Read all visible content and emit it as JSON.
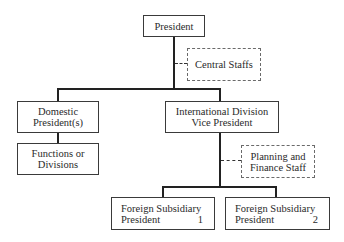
{
  "diagram": {
    "type": "organization-chart",
    "nodes": {
      "president": {
        "lines": [
          "President"
        ]
      },
      "central_staffs": {
        "lines": [
          "Central Staffs"
        ],
        "style": "dashed"
      },
      "domestic": {
        "lines": [
          "Domestic",
          "President(s)"
        ]
      },
      "functions": {
        "lines": [
          "Functions or",
          "Divisions"
        ]
      },
      "international": {
        "lines": [
          "International Division",
          "Vice President"
        ]
      },
      "planning": {
        "lines": [
          "Planning and",
          "Finance Staff"
        ],
        "style": "dashed"
      },
      "foreign1": {
        "line1": "Foreign Subsidiary",
        "line2_label": "President",
        "line2_num": "1"
      },
      "foreign2": {
        "line1": "Foreign Subsidiary",
        "line2_label": "President",
        "line2_num": "2"
      }
    },
    "edges": [
      {
        "from": "president",
        "to": "central_staffs",
        "style": "dotted"
      },
      {
        "from": "president",
        "to": "domestic",
        "style": "solid"
      },
      {
        "from": "president",
        "to": "international",
        "style": "solid"
      },
      {
        "from": "domestic",
        "to": "functions",
        "style": "solid"
      },
      {
        "from": "international",
        "to": "planning",
        "style": "dotted"
      },
      {
        "from": "international",
        "to": "foreign1",
        "style": "solid"
      },
      {
        "from": "international",
        "to": "foreign2",
        "style": "solid"
      }
    ]
  }
}
